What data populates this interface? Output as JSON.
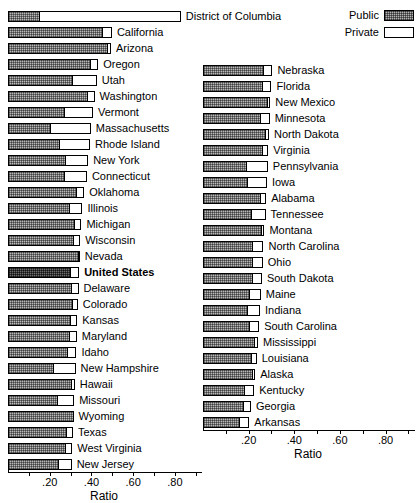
{
  "legend": {
    "items": [
      {
        "label": "Public",
        "swatch": "public-hatched-swatch"
      },
      {
        "label": "Private",
        "swatch": "private-white-swatch"
      }
    ]
  },
  "axis": {
    "title": "Ratio",
    "tick_labels": [
      ".20",
      ".40",
      ".60",
      ".80"
    ],
    "tick_values": [
      0.2,
      0.4,
      0.6,
      0.8
    ],
    "minor_tick_values": [
      0.1,
      0.3,
      0.5,
      0.7,
      0.9
    ],
    "min": 0.0,
    "max": 0.92
  },
  "chart_data": {
    "type": "bar",
    "orientation": "horizontal",
    "stacked": true,
    "title": "",
    "xlabel": "Ratio",
    "ylabel": "",
    "xlim": [
      0.0,
      0.92
    ],
    "grid": false,
    "legend_position": "top-right",
    "series": [
      {
        "name": "Public",
        "color": "#b9b9b9"
      },
      {
        "name": "Private",
        "color": "#ffffff"
      }
    ],
    "panels": [
      {
        "name": "left-panel",
        "categories": [
          "District of Columbia",
          "California",
          "Arizona",
          "Oregon",
          "Utah",
          "Washington",
          "Vermont",
          "Massachusetts",
          "Rhode Island",
          "New York",
          "Connecticut",
          "Oklahoma",
          "Illinois",
          "Michigan",
          "Wisconsin",
          "Nevada",
          "United States",
          "Delaware",
          "Colorado",
          "Kansas",
          "Maryland",
          "Idaho",
          "New Hampshire",
          "Hawaii",
          "Missouri",
          "Wyoming",
          "Texas",
          "West Virginia",
          "New Jersey"
        ],
        "rows": [
          {
            "label": "District of Columbia",
            "public": 0.152,
            "private": 0.676,
            "total": 0.828,
            "highlight": false
          },
          {
            "label": "California",
            "public": 0.455,
            "private": 0.043,
            "total": 0.498,
            "highlight": false
          },
          {
            "label": "Arizona",
            "public": 0.48,
            "private": 0.013,
            "total": 0.493,
            "highlight": false
          },
          {
            "label": "Oregon",
            "public": 0.396,
            "private": 0.036,
            "total": 0.432,
            "highlight": false
          },
          {
            "label": "Utah",
            "public": 0.313,
            "private": 0.112,
            "total": 0.425,
            "highlight": false
          },
          {
            "label": "Washington",
            "public": 0.384,
            "private": 0.031,
            "total": 0.415,
            "highlight": false
          },
          {
            "label": "Vermont",
            "public": 0.272,
            "private": 0.135,
            "total": 0.407,
            "highlight": false
          },
          {
            "label": "Massachusetts",
            "public": 0.208,
            "private": 0.189,
            "total": 0.397,
            "highlight": false
          },
          {
            "label": "Rhode Island",
            "public": 0.248,
            "private": 0.145,
            "total": 0.393,
            "highlight": false
          },
          {
            "label": "New York",
            "public": 0.28,
            "private": 0.104,
            "total": 0.384,
            "highlight": false
          },
          {
            "label": "Connecticut",
            "public": 0.271,
            "private": 0.107,
            "total": 0.378,
            "highlight": false
          },
          {
            "label": "Oklahoma",
            "public": 0.333,
            "private": 0.032,
            "total": 0.365,
            "highlight": false
          },
          {
            "label": "Illinois",
            "public": 0.296,
            "private": 0.061,
            "total": 0.357,
            "highlight": false
          },
          {
            "label": "Michigan",
            "public": 0.321,
            "private": 0.031,
            "total": 0.352,
            "highlight": false
          },
          {
            "label": "Wisconsin",
            "public": 0.318,
            "private": 0.028,
            "total": 0.346,
            "highlight": false
          },
          {
            "label": "Nevada",
            "public": 0.338,
            "private": 0.006,
            "total": 0.344,
            "highlight": false
          },
          {
            "label": "United States",
            "public": 0.301,
            "private": 0.04,
            "total": 0.341,
            "highlight": true
          },
          {
            "label": "Delaware",
            "public": 0.305,
            "private": 0.033,
            "total": 0.338,
            "highlight": false
          },
          {
            "label": "Colorado",
            "public": 0.313,
            "private": 0.021,
            "total": 0.334,
            "highlight": false
          },
          {
            "label": "Kansas",
            "public": 0.303,
            "private": 0.029,
            "total": 0.332,
            "highlight": false
          },
          {
            "label": "Maryland",
            "public": 0.295,
            "private": 0.035,
            "total": 0.33,
            "highlight": false
          },
          {
            "label": "Idaho",
            "public": 0.288,
            "private": 0.04,
            "total": 0.328,
            "highlight": false
          },
          {
            "label": "New Hampshire",
            "public": 0.219,
            "private": 0.105,
            "total": 0.324,
            "highlight": false
          },
          {
            "label": "Hawaii",
            "public": 0.306,
            "private": 0.014,
            "total": 0.32,
            "highlight": false
          },
          {
            "label": "Missouri",
            "public": 0.241,
            "private": 0.076,
            "total": 0.317,
            "highlight": false
          },
          {
            "label": "Wyoming",
            "public": 0.314,
            "private": 0.0,
            "total": 0.314,
            "highlight": false
          },
          {
            "label": "Texas",
            "public": 0.283,
            "private": 0.028,
            "total": 0.311,
            "highlight": false
          },
          {
            "label": "West Virginia",
            "public": 0.277,
            "private": 0.031,
            "total": 0.308,
            "highlight": false
          },
          {
            "label": "New Jersey",
            "public": 0.243,
            "private": 0.062,
            "total": 0.305,
            "highlight": false
          }
        ]
      },
      {
        "name": "right-panel",
        "categories": [
          "Nebraska",
          "Florida",
          "New Mexico",
          "Minnesota",
          "North Dakota",
          "Virginia",
          "Pennsylvania",
          "Iowa",
          "Alabama",
          "Tennessee",
          "Montana",
          "North Carolina",
          "Ohio",
          "South Dakota",
          "Maine",
          "Indiana",
          "South Carolina",
          "Mississippi",
          "Louisiana",
          "Alaska",
          "Kentucky",
          "Georgia",
          "Arkansas"
        ],
        "rows": [
          {
            "label": "Nebraska",
            "public": 0.268,
            "private": 0.036,
            "total": 0.304,
            "highlight": false
          },
          {
            "label": "Florida",
            "public": 0.264,
            "private": 0.036,
            "total": 0.3,
            "highlight": false
          },
          {
            "label": "New Mexico",
            "public": 0.283,
            "private": 0.012,
            "total": 0.295,
            "highlight": false
          },
          {
            "label": "Minnesota",
            "public": 0.254,
            "private": 0.038,
            "total": 0.292,
            "highlight": false
          },
          {
            "label": "North Dakota",
            "public": 0.277,
            "private": 0.012,
            "total": 0.289,
            "highlight": false
          },
          {
            "label": "Virginia",
            "public": 0.262,
            "private": 0.024,
            "total": 0.286,
            "highlight": false
          },
          {
            "label": "Pennsylvania",
            "public": 0.194,
            "private": 0.09,
            "total": 0.284,
            "highlight": false
          },
          {
            "label": "Iowa",
            "public": 0.196,
            "private": 0.084,
            "total": 0.28,
            "highlight": false
          },
          {
            "label": "Alabama",
            "public": 0.255,
            "private": 0.022,
            "total": 0.277,
            "highlight": false
          },
          {
            "label": "Tennessee",
            "public": 0.216,
            "private": 0.058,
            "total": 0.274,
            "highlight": false
          },
          {
            "label": "Montana",
            "public": 0.258,
            "private": 0.011,
            "total": 0.269,
            "highlight": false
          },
          {
            "label": "North Carolina",
            "public": 0.221,
            "private": 0.044,
            "total": 0.265,
            "highlight": false
          },
          {
            "label": "Ohio",
            "public": 0.219,
            "private": 0.043,
            "total": 0.262,
            "highlight": false
          },
          {
            "label": "South Dakota",
            "public": 0.219,
            "private": 0.039,
            "total": 0.258,
            "highlight": false
          },
          {
            "label": "Maine",
            "public": 0.208,
            "private": 0.045,
            "total": 0.253,
            "highlight": false
          },
          {
            "label": "Indiana",
            "public": 0.199,
            "private": 0.051,
            "total": 0.25,
            "highlight": false
          },
          {
            "label": "South Carolina",
            "public": 0.208,
            "private": 0.038,
            "total": 0.246,
            "highlight": false
          },
          {
            "label": "Mississippi",
            "public": 0.228,
            "private": 0.013,
            "total": 0.241,
            "highlight": false
          },
          {
            "label": "Louisiana",
            "public": 0.213,
            "private": 0.022,
            "total": 0.235,
            "highlight": false
          },
          {
            "label": "Alaska",
            "public": 0.221,
            "private": 0.008,
            "total": 0.229,
            "highlight": false
          },
          {
            "label": "Kentucky",
            "public": 0.186,
            "private": 0.038,
            "total": 0.224,
            "highlight": false
          },
          {
            "label": "Georgia",
            "public": 0.178,
            "private": 0.032,
            "total": 0.21,
            "highlight": false
          },
          {
            "label": "Arkansas",
            "public": 0.163,
            "private": 0.04,
            "total": 0.203,
            "highlight": false
          }
        ]
      }
    ]
  }
}
